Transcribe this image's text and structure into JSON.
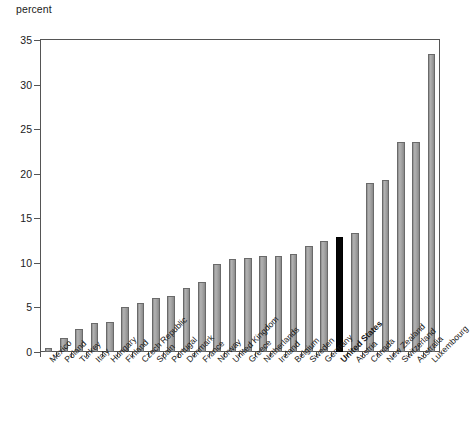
{
  "chart_data": {
    "type": "bar",
    "title": "",
    "subtitle": "",
    "xlabel": "",
    "ylabel": "percent",
    "ylim": [
      0,
      35
    ],
    "yticks": [
      0,
      5,
      10,
      15,
      20,
      25,
      30,
      35
    ],
    "grid": false,
    "legend": null,
    "categories": [
      "Mexico",
      "Poland",
      "Turkey",
      "Italy",
      "Hungary",
      "Finland",
      "Czech Republic",
      "Spain",
      "Portugal",
      "Denmark",
      "France",
      "Norway",
      "United Kingdom",
      "Greece",
      "Netherlands",
      "Ireland",
      "Belgium",
      "Sweden",
      "Germany",
      "United States",
      "Austria",
      "Canada",
      "New Zealand",
      "Switzerland",
      "Australia",
      "Luxembourg"
    ],
    "values": [
      0.5,
      1.6,
      2.6,
      3.3,
      3.4,
      5.1,
      5.5,
      6.1,
      6.3,
      7.2,
      7.9,
      9.9,
      10.4,
      10.5,
      10.8,
      10.8,
      11.0,
      11.9,
      12.5,
      12.9,
      13.4,
      19.0,
      19.3,
      23.6,
      23.6,
      33.4
    ],
    "highlight_category": "United States",
    "colors": {
      "bar": "#a2a2a2",
      "bar_border": "#6a6a6a",
      "highlight_bar": "#050505",
      "axis": "#555555",
      "text": "#1a1a1a",
      "background": "#ffffff"
    }
  }
}
